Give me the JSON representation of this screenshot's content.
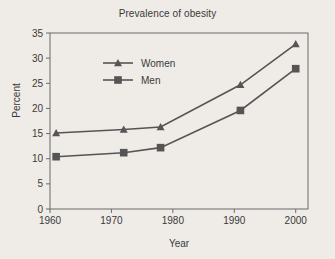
{
  "chart_data": {
    "type": "line",
    "title": "Prevalence of obesity",
    "xlabel": "Year",
    "ylabel": "Percent",
    "xlim": [
      1960,
      2002
    ],
    "ylim": [
      0,
      35
    ],
    "xticks": [
      1960,
      1970,
      1980,
      1990,
      2000
    ],
    "xtick_labels": [
      "1960",
      "1970",
      "1980",
      "1990",
      "2000"
    ],
    "yticks": [
      0,
      5,
      10,
      15,
      20,
      25,
      30,
      35
    ],
    "ytick_labels": [
      "0",
      "5",
      "10",
      "15",
      "20",
      "25",
      "30",
      "35"
    ],
    "grid": false,
    "legend_position": "upper left",
    "x": [
      1961,
      1972,
      1978,
      1991,
      2000
    ],
    "series": [
      {
        "name": "Women",
        "marker": "triangle",
        "color": "#555555",
        "values": [
          15.1,
          15.8,
          16.3,
          24.7,
          32.8
        ]
      },
      {
        "name": "Men",
        "marker": "square",
        "color": "#555555",
        "values": [
          10.4,
          11.2,
          12.2,
          19.6,
          27.9
        ]
      }
    ],
    "colors": {
      "background": "#efebe7",
      "axis": "#6b6b6b",
      "text": "#3a3a3a",
      "series": "#555555"
    }
  }
}
